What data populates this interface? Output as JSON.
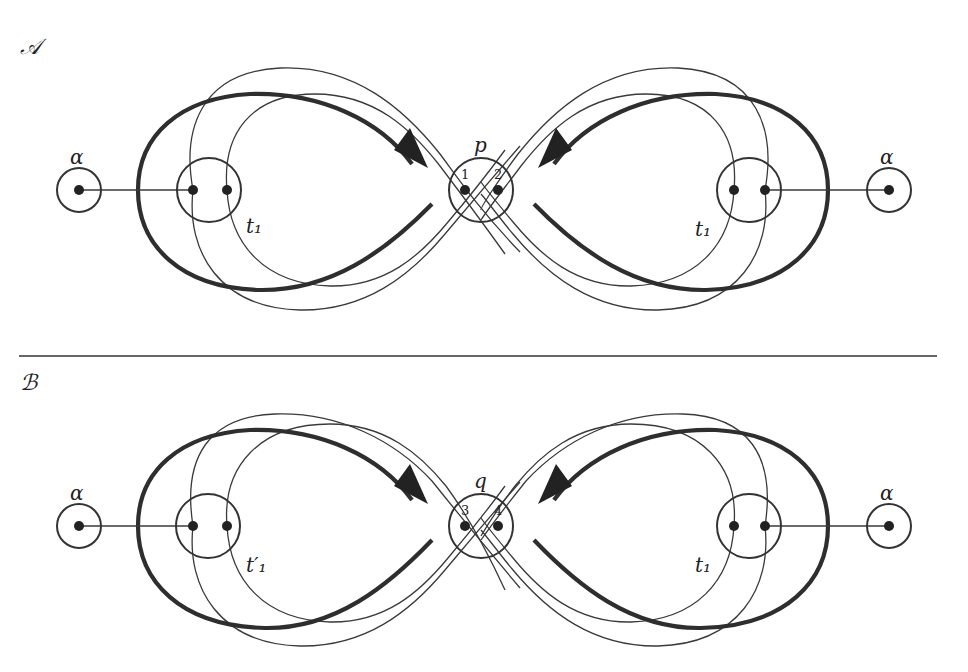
{
  "panels": [
    {
      "id": "A",
      "title": "𝒜",
      "left_outer_label": "α",
      "right_outer_label": "α",
      "left_inner_label": "t₁",
      "right_inner_label": "t₁",
      "center_label": "p",
      "center_left_number": "1",
      "center_right_number": "2"
    },
    {
      "id": "B",
      "title": "ℬ",
      "left_outer_label": "α",
      "right_outer_label": "α",
      "left_inner_label": "t′₁",
      "right_inner_label": "t₁",
      "center_label": "q",
      "center_left_number": "3",
      "center_right_number": "4"
    }
  ]
}
